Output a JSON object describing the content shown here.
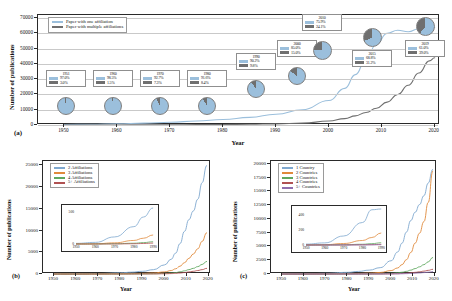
{
  "figure": {
    "panels": [
      "a",
      "b",
      "c"
    ]
  },
  "panel_a": {
    "letter": "(a)",
    "xlabel": "Year",
    "ylabel": "Number of publications",
    "legend": [
      {
        "label": "Paper with one affiliation",
        "color": "#9bbfdc"
      },
      {
        "label": "Paper with multiple affiliations",
        "color": "#6f6f6f"
      }
    ],
    "yticks": [
      "0",
      "10000",
      "20000",
      "30000",
      "40000",
      "50000",
      "60000",
      "70000"
    ],
    "xticks": [
      "1950",
      "1960",
      "1970",
      "1980",
      "1990",
      "2000",
      "2010",
      "2020"
    ],
    "callouts": [
      {
        "year": "1951",
        "single": "97.0%",
        "multiple": "3.0%"
      },
      {
        "year": "1960",
        "single": "98.5%",
        "multiple": "1.5%"
      },
      {
        "year": "1970",
        "single": "92.7%",
        "multiple": "7.3%"
      },
      {
        "year": "1980",
        "single": "91.6%",
        "multiple": "8.4%"
      },
      {
        "year": "1990",
        "single": "90.2%",
        "multiple": "9.8%"
      },
      {
        "year": "2000",
        "single": "85.0%",
        "multiple": "15.0%"
      },
      {
        "year": "2010",
        "single": "75.9%",
        "multiple": "24.1%"
      },
      {
        "year": "2015",
        "single": "68.8%",
        "multiple": "31.2%"
      },
      {
        "year": "2019",
        "single": "61.0%",
        "multiple": "39.0%"
      }
    ]
  },
  "panel_b": {
    "letter": "(b)",
    "xlabel": "Year",
    "ylabel": "Number of publications",
    "legend": [
      {
        "label": "2 Affiliations",
        "color": "#7fa8cf"
      },
      {
        "label": "3 Affiliations",
        "color": "#e08a3c"
      },
      {
        "label": "4 Affiliations",
        "color": "#5fa85f"
      },
      {
        "label": "5+ Affiliations",
        "color": "#b05252"
      }
    ],
    "yticks": [
      "0",
      "5000",
      "10000",
      "15000",
      "20000",
      "25000"
    ],
    "xticks": [
      "1950",
      "1960",
      "1970",
      "1980",
      "1990",
      "2000",
      "2010",
      "2020"
    ],
    "inset": {
      "yticks": [
        "0",
        "500"
      ],
      "xticks": [
        "1950",
        "1960",
        "1970",
        "1980",
        "1990"
      ]
    }
  },
  "panel_c": {
    "letter": "(c)",
    "xlabel": "Year",
    "ylabel": "Number of publications",
    "legend": [
      {
        "label": "1 Country",
        "color": "#7fa8cf"
      },
      {
        "label": "2 Countries",
        "color": "#e08a3c"
      },
      {
        "label": "3 Countries",
        "color": "#5fa85f"
      },
      {
        "label": "4 Countries",
        "color": "#b05252"
      },
      {
        "label": "5+ Countries",
        "color": "#8f6fae"
      }
    ],
    "yticks": [
      "0",
      "2500",
      "5000",
      "7500",
      "10000",
      "12500",
      "15000",
      "17500",
      "20000"
    ],
    "xticks": [
      "1950",
      "1960",
      "1970",
      "1980",
      "1990",
      "2000",
      "2010",
      "2020"
    ],
    "inset": {
      "yticks": [
        "0",
        "200",
        "400"
      ],
      "xticks": [
        "1950",
        "1960",
        "1970",
        "1980",
        "1990"
      ]
    }
  },
  "chart_data": [
    {
      "type": "line",
      "panel": "a",
      "title": "",
      "xlabel": "Year",
      "ylabel": "Number of publications",
      "xlim": [
        1945,
        2021
      ],
      "ylim": [
        0,
        72000
      ],
      "grid": true,
      "legend_position": "top-left",
      "x": [
        1950,
        1955,
        1960,
        1965,
        1970,
        1975,
        1980,
        1985,
        1990,
        1995,
        2000,
        2003,
        2005,
        2007,
        2009,
        2011,
        2013,
        2015,
        2017,
        2019,
        2020
      ],
      "series": [
        {
          "name": "Paper with one affiliation",
          "color": "#9bbfdc",
          "values": [
            300,
            500,
            800,
            1200,
            1800,
            2600,
            3600,
            5000,
            7000,
            10000,
            16000,
            24000,
            33000,
            43000,
            53000,
            60000,
            62000,
            61000,
            63000,
            66000,
            64000
          ]
        },
        {
          "name": "Paper with multiple affiliations",
          "color": "#6f6f6f",
          "values": [
            10,
            20,
            30,
            80,
            140,
            220,
            340,
            500,
            760,
            1200,
            2600,
            4200,
            6000,
            8200,
            11000,
            15000,
            20000,
            26000,
            34000,
            42000,
            44000
          ]
        }
      ],
      "annotations": [
        {
          "year": 1951,
          "single_pct": 97.0,
          "multiple_pct": 3.0
        },
        {
          "year": 1960,
          "single_pct": 98.5,
          "multiple_pct": 1.5
        },
        {
          "year": 1970,
          "single_pct": 92.7,
          "multiple_pct": 7.3
        },
        {
          "year": 1980,
          "single_pct": 91.6,
          "multiple_pct": 8.4
        },
        {
          "year": 1990,
          "single_pct": 90.2,
          "multiple_pct": 9.8
        },
        {
          "year": 2000,
          "single_pct": 85.0,
          "multiple_pct": 15.0
        },
        {
          "year": 2010,
          "single_pct": 75.9,
          "multiple_pct": 24.1
        },
        {
          "year": 2015,
          "single_pct": 68.8,
          "multiple_pct": 31.2
        },
        {
          "year": 2019,
          "single_pct": 61.0,
          "multiple_pct": 39.0
        }
      ]
    },
    {
      "type": "line",
      "panel": "b",
      "title": "",
      "xlabel": "Year",
      "ylabel": "Number of publications",
      "xlim": [
        1945,
        2021
      ],
      "ylim": [
        0,
        26000
      ],
      "grid": false,
      "legend_position": "top-left",
      "x": [
        1950,
        1960,
        1970,
        1980,
        1985,
        1990,
        1995,
        2000,
        2003,
        2005,
        2007,
        2009,
        2011,
        2013,
        2015,
        2017,
        2019
      ],
      "series": [
        {
          "name": "2 Affiliations",
          "color": "#7fa8cf",
          "values": [
            10,
            25,
            110,
            270,
            420,
            620,
            1000,
            2100,
            3400,
            4800,
            7000,
            9800,
            12500,
            14500,
            17200,
            21000,
            25000
          ]
        },
        {
          "name": "3 Affiliations",
          "color": "#e08a3c",
          "values": [
            1,
            3,
            18,
            55,
            90,
            140,
            240,
            480,
            800,
            1200,
            1800,
            2600,
            3600,
            4600,
            5800,
            7500,
            9500
          ]
        },
        {
          "name": "4 Affiliations",
          "color": "#5fa85f",
          "values": [
            0,
            1,
            4,
            12,
            22,
            35,
            60,
            130,
            220,
            330,
            500,
            720,
            1000,
            1300,
            1700,
            2200,
            2900
          ]
        },
        {
          "name": "5+ Affiliations",
          "color": "#b05252",
          "values": [
            0,
            0,
            1,
            4,
            8,
            14,
            25,
            55,
            95,
            150,
            230,
            330,
            470,
            620,
            800,
            1000,
            1300
          ]
        }
      ],
      "inset": {
        "xlim": [
          1950,
          1992
        ],
        "ylim": [
          0,
          560
        ],
        "yticks": [
          0,
          500
        ],
        "xticks": [
          1950,
          1960,
          1970,
          1980,
          1990
        ]
      }
    },
    {
      "type": "line",
      "panel": "c",
      "title": "",
      "xlabel": "Year",
      "ylabel": "Number of publications",
      "xlim": [
        1945,
        2021
      ],
      "ylim": [
        0,
        20500
      ],
      "grid": false,
      "legend_position": "top-left",
      "x": [
        1950,
        1960,
        1970,
        1980,
        1985,
        1990,
        1995,
        2000,
        2003,
        2005,
        2007,
        2009,
        2011,
        2013,
        2015,
        2017,
        2019
      ],
      "series": [
        {
          "name": "1 Country",
          "color": "#7fa8cf",
          "values": [
            12,
            28,
            120,
            300,
            470,
            700,
            1150,
            2400,
            4000,
            5600,
            7600,
            9700,
            11200,
            12600,
            14200,
            16500,
            19000
          ]
        },
        {
          "name": "2 Countries",
          "color": "#e08a3c",
          "values": [
            1,
            4,
            20,
            60,
            100,
            160,
            280,
            620,
            1100,
            1700,
            2600,
            3900,
            5600,
            7400,
            9500,
            13000,
            18700
          ]
        },
        {
          "name": "3 Countries",
          "color": "#5fa85f",
          "values": [
            0,
            1,
            3,
            10,
            18,
            30,
            55,
            120,
            210,
            320,
            480,
            700,
            980,
            1300,
            1700,
            2200,
            3000
          ]
        },
        {
          "name": "4 Countries",
          "color": "#b05252",
          "values": [
            0,
            0,
            1,
            3,
            5,
            9,
            16,
            35,
            62,
            95,
            145,
            210,
            300,
            400,
            520,
            660,
            850
          ]
        },
        {
          "name": "5+ Countries",
          "color": "#8f6fae",
          "values": [
            0,
            0,
            0,
            1,
            2,
            4,
            7,
            15,
            28,
            44,
            68,
            100,
            145,
            195,
            255,
            325,
            420
          ]
        }
      ],
      "inset": {
        "xlim": [
          1950,
          1992
        ],
        "ylim": [
          0,
          480
        ],
        "yticks": [
          0,
          200,
          400
        ],
        "xticks": [
          1950,
          1960,
          1970,
          1980,
          1990
        ]
      }
    }
  ]
}
